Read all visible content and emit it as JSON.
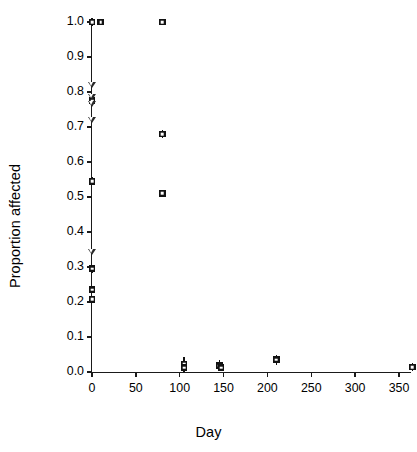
{
  "chart_data": {
    "type": "scatter",
    "title": "",
    "xlabel": "Day",
    "ylabel": "Proportion affected",
    "xlim": [
      -8,
      375
    ],
    "ylim": [
      0.0,
      1.0
    ],
    "grid": false,
    "legend": "none",
    "xticks": [
      0,
      50,
      100,
      150,
      200,
      250,
      300,
      350
    ],
    "xticklabels": [
      "0",
      "50",
      "100",
      "150",
      "200",
      "250",
      "300",
      "350"
    ],
    "yticks": [
      0.0,
      0.1,
      0.2,
      0.3,
      0.4,
      0.5,
      0.6,
      0.7,
      0.8,
      0.9,
      1.0
    ],
    "yticklabels": [
      "0.0",
      "0.1",
      "0.2",
      "0.3",
      "0.4",
      "0.5",
      "0.6",
      "0.7",
      "0.8",
      "0.9",
      "1.0"
    ],
    "series": [
      {
        "name": "filled-square",
        "marker": "filled-square",
        "color": "#121212",
        "points": [
          {
            "x": 0,
            "y": 1.0,
            "err": 0.012
          },
          {
            "x": 10,
            "y": 1.0,
            "err": 0.0
          },
          {
            "x": 80,
            "y": 1.0,
            "err": 0.0
          },
          {
            "x": 80,
            "y": 0.68,
            "err": 0.012
          },
          {
            "x": 80,
            "y": 0.51,
            "err": 0.01
          },
          {
            "x": 0,
            "y": 0.775,
            "err": 0.012
          },
          {
            "x": 0,
            "y": 0.545,
            "err": 0.012
          },
          {
            "x": 0,
            "y": 0.295,
            "err": 0.012
          },
          {
            "x": 0,
            "y": 0.235,
            "err": 0.01
          },
          {
            "x": 0,
            "y": 0.208,
            "err": 0.01
          },
          {
            "x": 105,
            "y": 0.022,
            "err": 0.02
          },
          {
            "x": 105,
            "y": 0.012,
            "err": 0.012
          },
          {
            "x": 145,
            "y": 0.018,
            "err": 0.016
          },
          {
            "x": 147,
            "y": 0.012,
            "err": 0.01
          },
          {
            "x": 210,
            "y": 0.035,
            "err": 0.014
          },
          {
            "x": 365,
            "y": 0.014,
            "err": 0.012
          }
        ]
      },
      {
        "name": "open-triangle-down",
        "marker": "open-triangle-down",
        "color": "#2a2a2a",
        "points": [
          {
            "x": 0,
            "y": 0.818
          },
          {
            "x": 0,
            "y": 0.783
          },
          {
            "x": 0,
            "y": 0.763
          },
          {
            "x": 0,
            "y": 0.718
          },
          {
            "x": 0,
            "y": 0.34
          }
        ]
      }
    ]
  }
}
